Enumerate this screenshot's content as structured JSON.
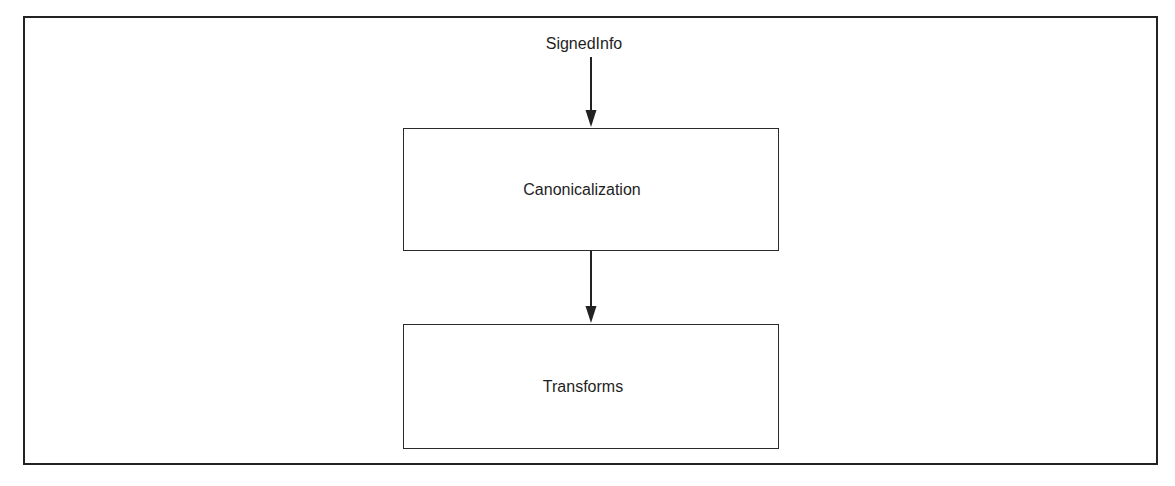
{
  "diagram": {
    "type": "flowchart",
    "direction": "top-to-bottom",
    "colors": {
      "background": "#ffffff",
      "stroke": "#222222",
      "text": "#1e1e1e"
    },
    "input": {
      "label": "SignedInfo"
    },
    "nodes": [
      {
        "id": "canonicalization",
        "label": "Canonicalization"
      },
      {
        "id": "transforms",
        "label": "Transforms"
      }
    ],
    "edges": [
      {
        "from": "SignedInfo",
        "to": "Canonicalization"
      },
      {
        "from": "Canonicalization",
        "to": "Transforms"
      }
    ]
  }
}
